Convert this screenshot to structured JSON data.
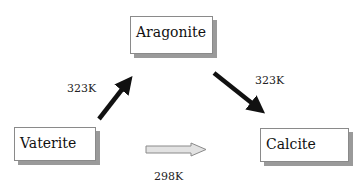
{
  "nodes": [
    {
      "id": "aragonite",
      "label": "Aragonite"
    },
    {
      "id": "vaterite",
      "label": "Vaterite"
    },
    {
      "id": "calcite",
      "label": "Calcite"
    }
  ],
  "edges": [
    {
      "from": "vaterite",
      "to": "aragonite",
      "label": "323K",
      "style": "black"
    },
    {
      "from": "aragonite",
      "to": "calcite",
      "label": "323K",
      "style": "black"
    },
    {
      "from": "vaterite",
      "to": "calcite",
      "label": "298K",
      "style": "gray-outline"
    }
  ]
}
